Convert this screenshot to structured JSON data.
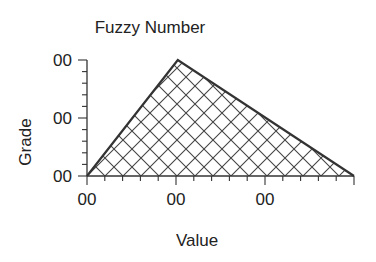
{
  "chart_data": {
    "type": "area",
    "title": "Fuzzy Number",
    "xlabel": "Value",
    "ylabel": "Grade",
    "xlim": [
      0,
      3
    ],
    "ylim": [
      0,
      1
    ],
    "x_ticks": [
      "00",
      "00",
      "00"
    ],
    "y_ticks": [
      "00",
      "00",
      "00"
    ],
    "x_major_values": [
      0,
      1,
      2
    ],
    "y_major_values": [
      0,
      0.5,
      1
    ],
    "x_minor_per_major": 5,
    "y_minor_per_major": 5,
    "series": [
      {
        "name": "membership",
        "x": [
          0,
          1.02,
          3
        ],
        "y": [
          0,
          1,
          0
        ],
        "fill": "crosshatch"
      }
    ],
    "grid": false,
    "legend": "none"
  },
  "colors": {
    "line": "#333333",
    "hatch": "#444444",
    "text": "#222222"
  }
}
